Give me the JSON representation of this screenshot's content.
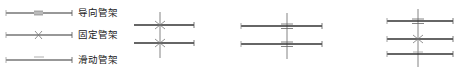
{
  "legend": {
    "items": [
      {
        "symbol": "guide-support-symbol",
        "label": "导向管架"
      },
      {
        "symbol": "fixed-support-symbol",
        "label": "固定管架"
      },
      {
        "symbol": "sliding-support-symbol",
        "label": "滑动管架"
      }
    ]
  },
  "diagrams": [
    {
      "name": "two-pipes-fixed-supports",
      "pipes": 2,
      "supports": [
        "fixed",
        "fixed"
      ]
    },
    {
      "name": "two-pipes-guide-supports",
      "pipes": 2,
      "supports": [
        "guide",
        "guide"
      ]
    },
    {
      "name": "three-pipes-mixed-supports",
      "pipes": 3,
      "supports": [
        "guide",
        "fixed",
        "sliding"
      ]
    }
  ],
  "colors": {
    "line": "#333333",
    "light": "#888888",
    "text": "#222222"
  }
}
